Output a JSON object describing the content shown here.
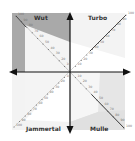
{
  "quadrants": {
    "top_left": {
      "label": "Wut",
      "color": "#a9a9a9"
    },
    "top_right": {
      "label": "Turbo",
      "color": "#f2f2f2"
    },
    "bottom_left": {
      "label": "Jammertal",
      "color": "#f2f2f2"
    },
    "bottom_right": {
      "label": "Mulle",
      "color": "#e4e4e4"
    }
  },
  "scale_labels": [
    "10",
    "20",
    "30",
    "40",
    "50",
    "60",
    "70",
    "80",
    "90",
    "100"
  ],
  "colors": {
    "axis": "#111111",
    "diagonal": "#333333",
    "inner": "#ffffff"
  }
}
